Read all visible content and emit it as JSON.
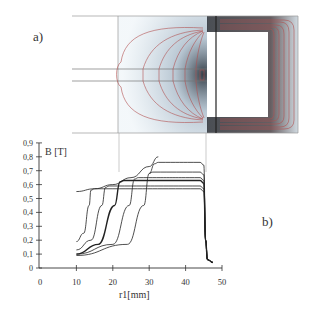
{
  "panel_a": {
    "label": "a)"
  },
  "panel_b": {
    "label": "b)"
  },
  "chart_data": [
    {
      "type": "diagram",
      "title": "a) magnetic field distribution in core (flux lines)",
      "description": "Cross-section of magnetic circuit with rectangular window, rod inserted from left, flux lines shown in red"
    },
    {
      "type": "line",
      "title": "b)",
      "xlabel": "r1[mm]",
      "ylabel": "B [T]",
      "xlim": [
        0,
        50
      ],
      "ylim": [
        0,
        0.9
      ],
      "xticks": [
        0,
        10,
        20,
        30,
        40,
        50
      ],
      "yticks": [
        "0",
        "0,1",
        "0,2",
        "0,3",
        "0,4",
        "0,5",
        "0,6",
        "0,7",
        "0,8",
        "0,9"
      ],
      "grid": false,
      "series": [
        {
          "name": "curve 1",
          "x": [
            10,
            12,
            13.5,
            14,
            15,
            44,
            45,
            45.5,
            46,
            47.5
          ],
          "y": [
            0.19,
            0.25,
            0.45,
            0.56,
            0.57,
            0.57,
            0.55,
            0.2,
            0.06,
            0.04
          ]
        },
        {
          "name": "curve 2",
          "x": [
            10,
            14,
            17,
            18,
            19,
            44,
            45,
            45.5,
            46,
            47.5
          ],
          "y": [
            0.13,
            0.2,
            0.45,
            0.58,
            0.59,
            0.59,
            0.57,
            0.2,
            0.06,
            0.04
          ]
        },
        {
          "name": "curve 3 (bold)",
          "x": [
            10,
            16,
            20.5,
            22,
            23,
            44,
            45,
            45.5,
            46,
            47.5
          ],
          "y": [
            0.1,
            0.17,
            0.45,
            0.62,
            0.63,
            0.63,
            0.61,
            0.2,
            0.06,
            0.04
          ]
        },
        {
          "name": "curve 4",
          "x": [
            10,
            20,
            24.5,
            26,
            27,
            44,
            45,
            45.5,
            46,
            47.5
          ],
          "y": [
            0.1,
            0.17,
            0.45,
            0.64,
            0.65,
            0.65,
            0.63,
            0.2,
            0.06,
            0.04
          ]
        },
        {
          "name": "curve 5",
          "x": [
            10,
            24,
            28.5,
            30,
            31,
            44,
            45,
            45.5,
            46,
            47.5
          ],
          "y": [
            0.09,
            0.17,
            0.45,
            0.68,
            0.69,
            0.69,
            0.67,
            0.2,
            0.06,
            0.04
          ]
        },
        {
          "name": "curve 6",
          "x": [
            30,
            31.5,
            32.5,
            44,
            45,
            45.5,
            46,
            47.5
          ],
          "y": [
            0.68,
            0.75,
            0.76,
            0.76,
            0.74,
            0.2,
            0.06,
            0.04
          ]
        },
        {
          "name": "envelope",
          "x": [
            10,
            15,
            20,
            25,
            30,
            32.5
          ],
          "y": [
            0.55,
            0.57,
            0.6,
            0.65,
            0.73,
            0.8
          ]
        }
      ]
    }
  ]
}
